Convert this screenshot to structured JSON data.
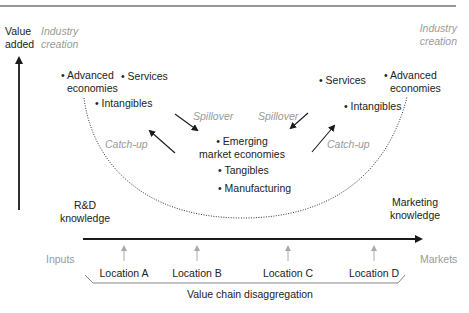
{
  "diagram": {
    "type": "smile-curve",
    "axes": {
      "y_label_line1": "Value",
      "y_label_line2": "added",
      "x_left_label": "Inputs",
      "x_right_label": "Markets"
    },
    "top_left": {
      "industry_creation_line1": "Industry",
      "industry_creation_line2": "creation"
    },
    "top_right": {
      "industry_creation_line1": "Industry",
      "industry_creation_line2": "creation"
    },
    "left_side": {
      "advanced_line1": "• Advanced",
      "advanced_line2": "economies",
      "services": "• Services",
      "intangibles": "• Intangibles",
      "spillover": "Spillover",
      "catchup": "Catch-up",
      "knowledge_line1": "R&D",
      "knowledge_line2": "knowledge"
    },
    "right_side": {
      "advanced_line1": "• Advanced",
      "advanced_line2": "economies",
      "services": "• Services",
      "intangibles": "• Intangibles",
      "spillover": "Spillover",
      "catchup": "Catch-up",
      "knowledge_line1": "Marketing",
      "knowledge_line2": "knowledge"
    },
    "center": {
      "emerging_line1": "• Emerging",
      "emerging_line2": "market economies",
      "tangibles": "• Tangibles",
      "manufacturing": "• Manufacturing"
    },
    "locations": [
      "Location A",
      "Location B",
      "Location C",
      "Location D"
    ],
    "bracket_label": "Value chain disaggregation",
    "colors": {
      "text": "#222222",
      "muted": "#9a9a9a",
      "line": "#1a1a1a"
    }
  }
}
